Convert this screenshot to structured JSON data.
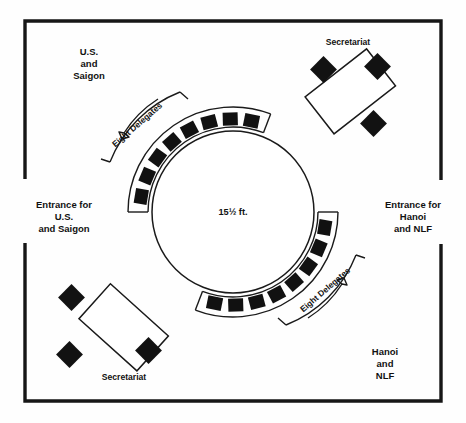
{
  "diagram": {
    "colors": {
      "ink": "#161616",
      "paper": "#fefefe",
      "chair_fill": "#111111"
    },
    "room": {
      "name": "conference-room",
      "entrances": [
        {
          "id": "entrance-left",
          "side": "left",
          "label_lines": [
            "Entrance for",
            "U.S.",
            "and Saigon"
          ]
        },
        {
          "id": "entrance-right",
          "side": "right",
          "label_lines": [
            "Entrance for",
            "Hanoi",
            "and NLF"
          ]
        }
      ]
    },
    "delegation_labels": [
      {
        "id": "delegation-us-saigon",
        "position": "top-left",
        "lines": [
          "U.S.",
          "and",
          "Saigon"
        ]
      },
      {
        "id": "delegation-hanoi-nlf",
        "position": "bottom-right",
        "lines": [
          "Hanoi",
          "and",
          "NLF"
        ]
      }
    ],
    "main_table": {
      "id": "round-table",
      "shape": "circle",
      "dimension_label": "15½ ft.",
      "seat_groups": [
        {
          "id": "delegates-upper-left",
          "label": "Eight Delegates",
          "seat_count": 8,
          "arc_start_deg": 183,
          "arc_end_deg": 288
        },
        {
          "id": "delegates-lower-right",
          "label": "Eight Delegates",
          "seat_count": 8,
          "arc_start_deg": 3,
          "arc_end_deg": 108
        }
      ]
    },
    "secretariat_tables": [
      {
        "id": "secretariat-top-right",
        "label": "Secretariat",
        "label_position": "above",
        "rotation_deg": -38,
        "chair_count": 3
      },
      {
        "id": "secretariat-bottom-left",
        "label": "Secretariat",
        "label_position": "below",
        "rotation_deg": 42,
        "chair_count": 3
      }
    ]
  }
}
